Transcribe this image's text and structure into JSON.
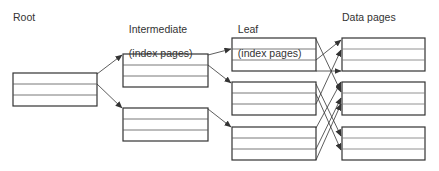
{
  "labels": {
    "root": "Root",
    "intermediate_line1": "Intermediate",
    "intermediate_line2": "(index pages)",
    "leaf_line1": "Leaf",
    "leaf_line2": "(index pages)",
    "data": "Data pages"
  },
  "colors": {
    "stroke": "#333333",
    "row_line": "#555555",
    "text": "#333333",
    "background": "#ffffff"
  },
  "levels": [
    {
      "name": "root",
      "boxes": 1
    },
    {
      "name": "intermediate",
      "boxes": 2
    },
    {
      "name": "leaf",
      "boxes": 3
    },
    {
      "name": "data",
      "boxes": 3
    }
  ]
}
